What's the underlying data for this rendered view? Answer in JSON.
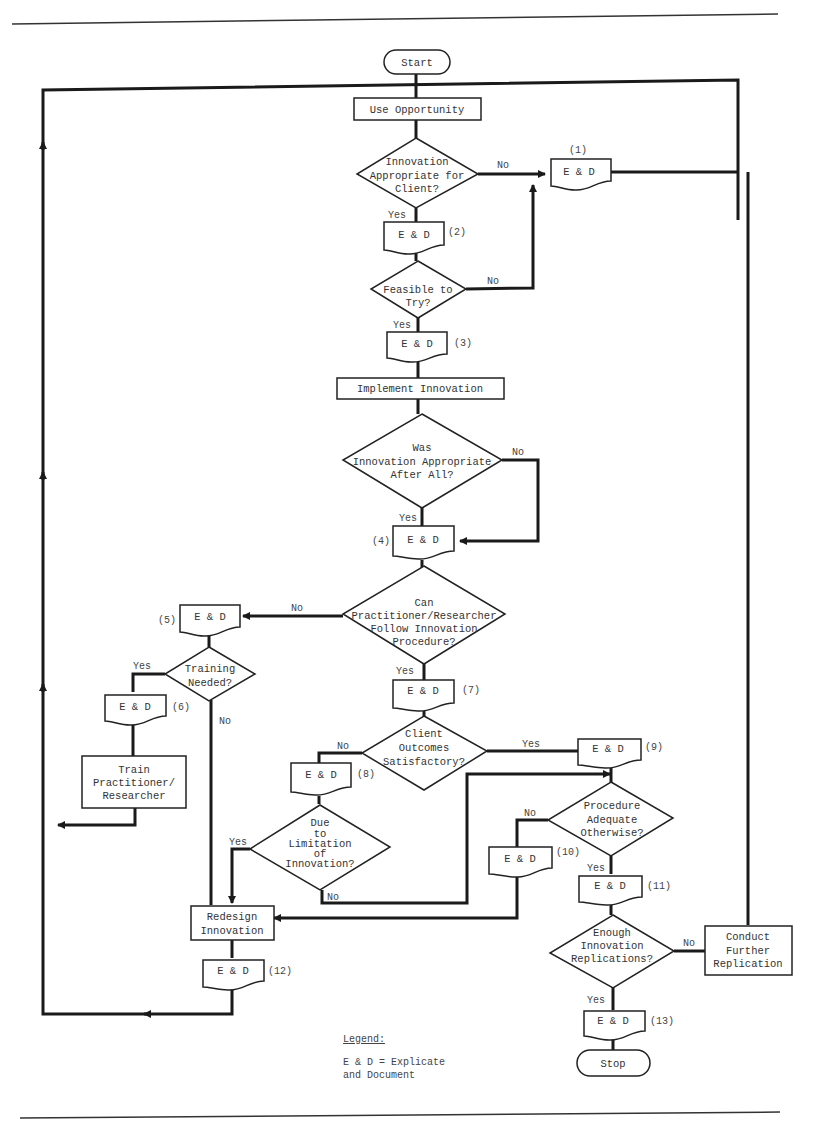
{
  "diagram": {
    "type": "flowchart",
    "terminals": {
      "start": "Start",
      "stop": "Stop"
    },
    "processes": {
      "use_opportunity": "Use Opportunity",
      "implement": "Implement Innovation",
      "train": [
        "Train",
        "Practitioner/",
        "Researcher"
      ],
      "redesign": [
        "Redesign",
        "Innovation"
      ],
      "conduct": [
        "Conduct",
        "Further",
        "Replication"
      ]
    },
    "decisions": {
      "appropriate": [
        "Innovation",
        "Appropriate for",
        "Client?"
      ],
      "feasible": [
        "Feasible to",
        "Try?"
      ],
      "after_all": [
        "Was",
        "Innovation Appropriate",
        "After All?"
      ],
      "follow": [
        "Can",
        "Practitioner/Researcher",
        "Follow Innovation",
        "Procedure?"
      ],
      "training": [
        "Training",
        "Needed?"
      ],
      "outcomes": [
        "Client",
        "Outcomes",
        "Satisfactory?"
      ],
      "limitation": [
        "Due",
        "to",
        "Limitation",
        "of",
        "Innovation?"
      ],
      "adequate": [
        "Procedure",
        "Adequate",
        "Otherwise?"
      ],
      "replications": [
        "Enough",
        "Innovation",
        "Replications?"
      ]
    },
    "documents": {
      "label": "E & D",
      "numbers": [
        "(1)",
        "(2)",
        "(3)",
        "(4)",
        "(5)",
        "(6)",
        "(7)",
        "(8)",
        "(9)",
        "(10)",
        "(11)",
        "(12)",
        "(13)"
      ]
    },
    "edge_labels": {
      "yes": "Yes",
      "no": "No"
    },
    "legend": {
      "title": "Legend:",
      "lines": [
        "E & D = Explicate",
        "and Document"
      ]
    }
  }
}
